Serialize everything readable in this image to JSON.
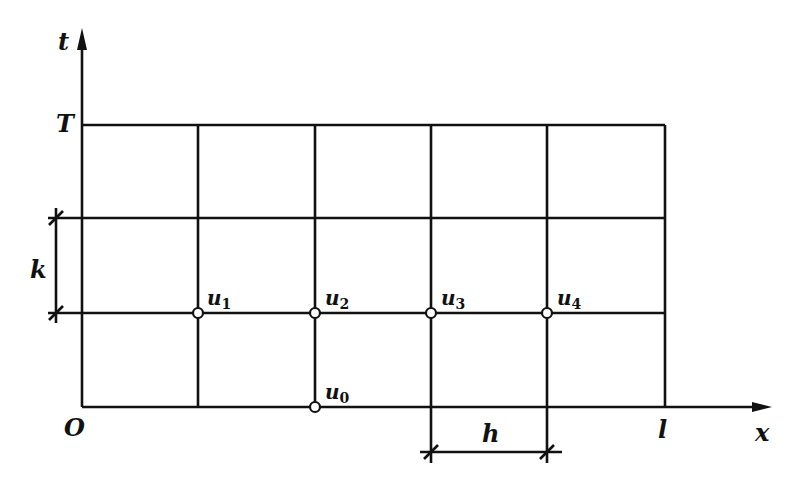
{
  "figure": {
    "stroke_color": "#111111",
    "background": "#ffffff",
    "axes": {
      "t_label": "t",
      "x_label": "x",
      "origin_label": "O",
      "T_label": "T",
      "l_label": "l"
    },
    "grid": {
      "columns": 5,
      "rows": 3,
      "vertical_lines_px": [
        82,
        198,
        315,
        431,
        547,
        665
      ],
      "horizontal_lines_px": [
        125,
        218,
        313,
        407
      ]
    },
    "dimensions": {
      "k_label": "k",
      "h_label": "h"
    },
    "nodes": [
      {
        "name": "u",
        "sub": "1",
        "x": 198,
        "y": 313
      },
      {
        "name": "u",
        "sub": "2",
        "x": 315,
        "y": 313
      },
      {
        "name": "u",
        "sub": "3",
        "x": 431,
        "y": 313
      },
      {
        "name": "u",
        "sub": "4",
        "x": 547,
        "y": 313
      },
      {
        "name": "u",
        "sub": "0",
        "x": 315,
        "y": 407
      }
    ]
  }
}
